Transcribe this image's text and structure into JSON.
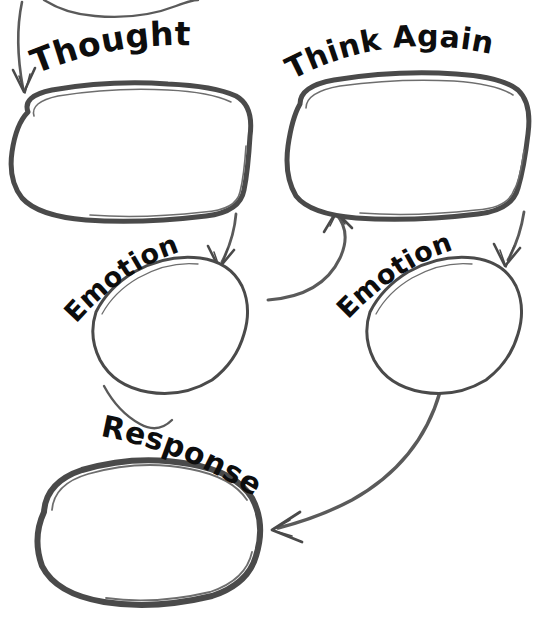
{
  "document": {
    "title": "Thought - Think Again - Emotion - Response Worksheet",
    "background_color": "#ffffff",
    "ink_color": "#4a4a4a",
    "text_color": "#0d0d0d",
    "width": 540,
    "height": 621
  },
  "nodes": [
    {
      "id": "thought",
      "label": "Thought",
      "content": "",
      "position": "top-left",
      "shape": "hand-drawn-blob"
    },
    {
      "id": "think-again",
      "label": "Think Again",
      "content": "",
      "position": "top-right",
      "shape": "hand-drawn-blob"
    },
    {
      "id": "emotion-left",
      "label": "Emotion",
      "content": "",
      "position": "middle-left",
      "shape": "hand-drawn-blob-tilted"
    },
    {
      "id": "emotion-right",
      "label": "Emotion",
      "content": "",
      "position": "middle-right",
      "shape": "hand-drawn-blob-tilted"
    },
    {
      "id": "response",
      "label": "Response",
      "content": "",
      "position": "bottom-left",
      "shape": "hand-drawn-blob"
    }
  ],
  "connectors": [
    {
      "id": "in-to-thought",
      "from": "top-edge",
      "to": "thought",
      "style": "arrow"
    },
    {
      "id": "thought-to-think-again",
      "from": "thought",
      "to": "think-again",
      "style": "curved-arrow"
    },
    {
      "id": "thought-to-emotion-left",
      "from": "thought",
      "to": "emotion-left",
      "style": "arrow"
    },
    {
      "id": "think-again-to-emotion-right",
      "from": "think-again",
      "to": "emotion-right",
      "style": "arrow"
    },
    {
      "id": "emotion-left-to-response",
      "from": "emotion-left",
      "to": "response",
      "style": "line"
    },
    {
      "id": "emotion-right-to-response",
      "from": "emotion-right",
      "to": "response",
      "style": "curved-arrow"
    }
  ],
  "watermark": {
    "symbol": "cross-plus",
    "location": "inside-response-box"
  }
}
